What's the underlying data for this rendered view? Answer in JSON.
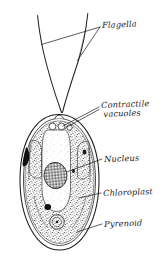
{
  "figure": {
    "style": "hand-drawn ink line diagram, stippled shading",
    "background_color": "#ffffff",
    "ink_color": "#171717",
    "labels": [
      {
        "id": "flagella",
        "text": "Flagella",
        "lines": [
          "Flagella"
        ]
      },
      {
        "id": "vacuoles",
        "text": "Contractile vacuoles",
        "lines": [
          "Contractile",
          "vacuoles"
        ]
      },
      {
        "id": "nucleus",
        "text": "Nucleus",
        "lines": [
          "Nucleus"
        ]
      },
      {
        "id": "chloroplast",
        "text": "Chloroplast",
        "lines": [
          "Chloroplast"
        ]
      },
      {
        "id": "pyrenoid",
        "text": "Pyrenoid",
        "lines": [
          "Pyrenoid"
        ]
      }
    ],
    "parts": [
      {
        "name": "flagellum-left",
        "description": "long whip curving up-left from apex"
      },
      {
        "name": "flagellum-right",
        "description": "long whip curving up-right from apex"
      },
      {
        "name": "cell-wall",
        "description": "outer ovoid double outline"
      },
      {
        "name": "chloroplast",
        "description": "stippled cup-shaped body filling the cell"
      },
      {
        "name": "cytoplasm-channel",
        "description": "pale U-shaped region in the centre"
      },
      {
        "name": "nucleus",
        "description": "cross-hatched ellipse in the central channel"
      },
      {
        "name": "pyrenoid",
        "description": "small ringed circle with central dot, lower centre"
      },
      {
        "name": "contractile-vacuoles",
        "description": "two small circles at the apex near flagella bases"
      },
      {
        "name": "eyespot",
        "description": "dark solid patches in the chloroplast"
      }
    ]
  }
}
